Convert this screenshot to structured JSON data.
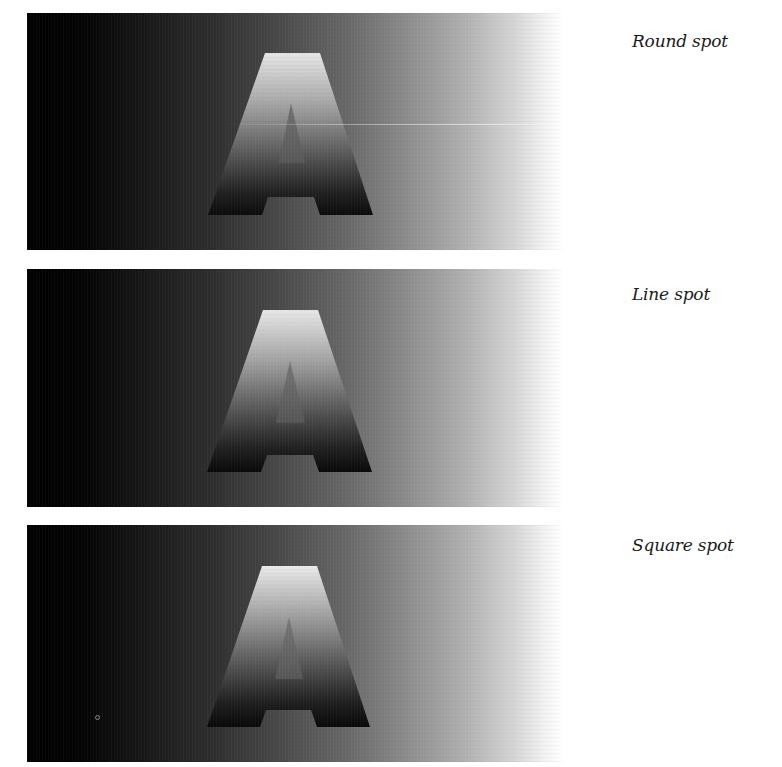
{
  "figure": {
    "panels": [
      {
        "caption": "Round spot",
        "letter": "A"
      },
      {
        "caption": "Line spot",
        "letter": "A"
      },
      {
        "caption": "Square spot",
        "letter": "A"
      }
    ]
  },
  "colors": {
    "background": "#ffffff",
    "gradient_start": "#000000",
    "gradient_end": "#ffffff",
    "caption_text": "#1a1a1a"
  }
}
